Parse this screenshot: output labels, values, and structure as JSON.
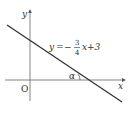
{
  "diagram": {
    "axes": {
      "x_label": "x",
      "y_label": "y",
      "origin_label": "O"
    },
    "line": {
      "equation_lhs": "y",
      "equation_eq": "=",
      "equation_sign": "−",
      "fraction_num": "3",
      "fraction_den": "4",
      "equation_rest": "x+3",
      "slope": -0.75,
      "intercept": 3
    },
    "angle_label": "α",
    "colors": {
      "line": "#333333",
      "axis": "#555555"
    }
  }
}
